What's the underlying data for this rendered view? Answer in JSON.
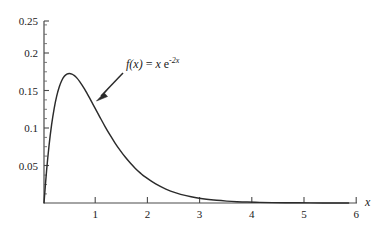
{
  "chart_data": {
    "type": "line",
    "title": "",
    "xlabel": "x",
    "ylabel": "",
    "xlim": [
      0,
      6.15
    ],
    "ylim": [
      0,
      0.2583
    ],
    "grid": false,
    "legend_position": "none",
    "function": "f(x) = x e^(-2x)",
    "x_ticks": [
      1,
      2,
      3,
      4,
      5,
      6
    ],
    "x_tick_labels": [
      "1",
      "2",
      "3",
      "4",
      "5",
      "6"
    ],
    "y_ticks": [
      0.05,
      0.1,
      0.15,
      0.2,
      0.25
    ],
    "y_tick_labels": [
      "0.05",
      "0.1",
      "0.15",
      "0.2",
      "0.25"
    ],
    "x_minor_tick_step": 0.25,
    "y_minor_tick_step": 0.0125,
    "peak": {
      "x": 0.5,
      "y": 0.1839
    },
    "series": [
      {
        "name": "f(x) = x e^-2x",
        "color": "#2b2b2b",
        "x": [
          0,
          0.05,
          0.1,
          0.15,
          0.2,
          0.25,
          0.3,
          0.35,
          0.4,
          0.45,
          0.5,
          0.55,
          0.6,
          0.65,
          0.7,
          0.75,
          0.8,
          0.85,
          0.9,
          0.95,
          1.0,
          1.1,
          1.2,
          1.3,
          1.4,
          1.5,
          1.6,
          1.7,
          1.8,
          1.9,
          2.0,
          2.2,
          2.4,
          2.6,
          2.8,
          3.0,
          3.2,
          3.4,
          3.6,
          3.8,
          4.0,
          4.25,
          4.5,
          4.75,
          5.0,
          5.25,
          5.5,
          5.75,
          6.0
        ],
        "y": [
          0,
          0.0452,
          0.0819,
          0.1111,
          0.1341,
          0.1516,
          0.1646,
          0.1738,
          0.1798,
          0.183,
          0.1839,
          0.183,
          0.1807,
          0.1772,
          0.1726,
          0.1673,
          0.1615,
          0.1552,
          0.1487,
          0.142,
          0.1353,
          0.122,
          0.1089,
          0.0966,
          0.0851,
          0.0747,
          0.0652,
          0.0567,
          0.0491,
          0.0424,
          0.0366,
          0.027,
          0.0198,
          0.0144,
          0.0104,
          0.0074,
          0.0053,
          0.0038,
          0.0027,
          0.0019,
          0.0013,
          0.00086,
          0.00056,
          0.00036,
          0.00023,
          0.00014,
          9e-05,
          6e-05,
          4e-05
        ]
      }
    ],
    "annotations": [
      {
        "name": "function-label",
        "text": "f(x) = x e^-2x",
        "text_parts": {
          "f": "f",
          "of_x": "(x)",
          "equals": " = ",
          "x": "x",
          "e": " e",
          "exponent": "-2x"
        },
        "position": {
          "x": 126,
          "y": 58
        },
        "arrow": {
          "from": {
            "x": 124,
            "y": 72
          },
          "to": {
            "x": 96,
            "y": 101
          },
          "color": "#2b2b2b"
        }
      }
    ],
    "axis_color": "#4a4a4a",
    "background": "#ffffff"
  }
}
